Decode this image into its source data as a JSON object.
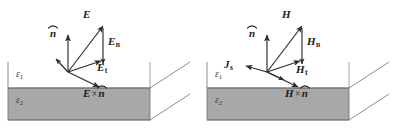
{
  "figure": {
    "background_color": "#ffffff",
    "slab_fill": "#a8a8a8",
    "line_color": "#333333",
    "label_color": "#1b1b1b"
  },
  "panels": [
    {
      "id": "electric-field-panel",
      "field_symbol": "E",
      "media": {
        "upper": "ε",
        "upper_sub": "1",
        "lower": "ε",
        "lower_sub": "2"
      },
      "labels": {
        "field": "E",
        "normal": "n",
        "normal_component": "E",
        "normal_component_sub": "n",
        "tangential": "E",
        "tangential_sub": "t",
        "cross_first": "E",
        "cross_symbol": "×",
        "cross_second": "n",
        "surface_current": "",
        "surface_current_sub": ""
      },
      "vectors": [
        {
          "name": "E",
          "from": [
            68,
            72
          ],
          "to": [
            104,
            24
          ],
          "style": "solid"
        },
        {
          "name": "n-hat",
          "from": [
            68,
            72
          ],
          "to": [
            68,
            34
          ],
          "style": "solid"
        },
        {
          "name": "E-n",
          "from": [
            104,
            26
          ],
          "to": [
            104,
            66
          ],
          "style": "solid"
        },
        {
          "name": "E-t",
          "from": [
            68,
            72
          ],
          "to": [
            104,
            62
          ],
          "style": "solid"
        },
        {
          "name": "E-cross-n",
          "from": [
            68,
            72
          ],
          "to": [
            101,
            88
          ],
          "style": "solid"
        },
        {
          "name": "stub-up-left",
          "from": [
            68,
            72
          ],
          "to": [
            55,
            58
          ],
          "style": "solid"
        }
      ]
    },
    {
      "id": "magnetic-field-panel",
      "field_symbol": "H",
      "media": {
        "upper": "ε",
        "upper_sub": "1",
        "lower": "ε",
        "lower_sub": "2"
      },
      "labels": {
        "field": "H",
        "normal": "n",
        "normal_component": "H",
        "normal_component_sub": "n",
        "tangential": "H",
        "tangential_sub": "t",
        "cross_first": "H",
        "cross_symbol": "×",
        "cross_second": "n",
        "surface_current": "J",
        "surface_current_sub": "s"
      },
      "vectors": [
        {
          "name": "H",
          "from": [
            68,
            72
          ],
          "to": [
            104,
            24
          ],
          "style": "solid"
        },
        {
          "name": "n-hat",
          "from": [
            68,
            72
          ],
          "to": [
            68,
            34
          ],
          "style": "solid"
        },
        {
          "name": "H-n",
          "from": [
            104,
            26
          ],
          "to": [
            104,
            66
          ],
          "style": "solid"
        },
        {
          "name": "H-t",
          "from": [
            68,
            72
          ],
          "to": [
            104,
            62
          ],
          "style": "solid"
        },
        {
          "name": "H-cross-n",
          "from": [
            68,
            72
          ],
          "to": [
            101,
            88
          ],
          "style": "solid"
        },
        {
          "name": "J-s",
          "from": [
            68,
            72
          ],
          "to": [
            46,
            66
          ],
          "style": "solid"
        },
        {
          "name": "stub-down-right",
          "from": [
            68,
            72
          ],
          "to": [
            86,
            80
          ],
          "style": "solid"
        }
      ]
    }
  ],
  "slab": {
    "front_top_y": 88,
    "front_bottom_y": 120,
    "left_x": 8,
    "right_x": 150,
    "depth_dx": 40,
    "depth_dy": -26
  }
}
